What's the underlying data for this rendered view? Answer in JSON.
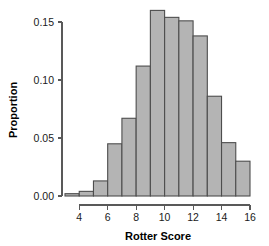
{
  "chart_data": {
    "type": "bar",
    "title": "",
    "subtitle": "",
    "xlabel": "Rotter Score",
    "ylabel": "Proportion",
    "grid": false,
    "legend": false,
    "legend_position": "none",
    "bar_fill_color": "#b4b4b4",
    "bar_edge_color": "#4d4d4d",
    "axis_color": "#595959",
    "background_color": "#ffffff",
    "xlim": [
      3,
      16
    ],
    "ylim": [
      0,
      0.168
    ],
    "xticks": [
      4,
      6,
      8,
      10,
      12,
      14,
      16
    ],
    "xtick_labels": [
      "4",
      "6",
      "8",
      "10",
      "12",
      "14",
      "16"
    ],
    "yticks": [
      0.0,
      0.05,
      0.1,
      0.15
    ],
    "ytick_labels": [
      "0.00",
      "0.05",
      "0.10",
      "0.15"
    ],
    "bin_width": 1,
    "bin_edges": [
      3,
      4,
      5,
      6,
      7,
      8,
      9,
      10,
      11,
      12,
      13,
      14,
      15,
      16
    ],
    "categories": [
      "3-4",
      "4-5",
      "5-6",
      "6-7",
      "7-8",
      "8-9",
      "9-10",
      "10-11",
      "11-12",
      "12-13",
      "13-14",
      "14-15",
      "15-16"
    ],
    "values": [
      0.002,
      0.004,
      0.013,
      0.045,
      0.067,
      0.112,
      0.16,
      0.154,
      0.151,
      0.138,
      0.086,
      0.046,
      0.03
    ]
  }
}
